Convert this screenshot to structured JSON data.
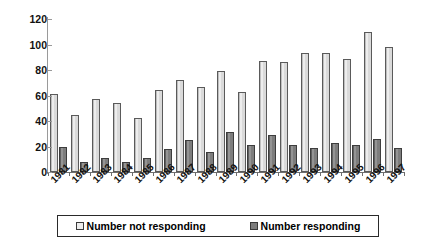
{
  "chart_data": {
    "type": "bar",
    "title": "",
    "xlabel": "",
    "ylabel": "",
    "ylim": [
      0,
      120
    ],
    "yticks": [
      0,
      20,
      40,
      60,
      80,
      100,
      120
    ],
    "grid": false,
    "legend_position": "bottom",
    "categories": [
      "1981",
      "1982",
      "1983",
      "1984",
      "1985",
      "1986",
      "1987",
      "1988",
      "1989",
      "1990",
      "1991",
      "1992",
      "1993",
      "1994",
      "1995",
      "1996",
      "1997"
    ],
    "series": [
      {
        "name": "Number not responding",
        "color": "#dcdcdc",
        "values": [
          61,
          45,
          57,
          54,
          42,
          64,
          72,
          67,
          79,
          63,
          87,
          86,
          93,
          93,
          89,
          110,
          98
        ]
      },
      {
        "name": "Number responding",
        "color": "#808080",
        "values": [
          20,
          8,
          11,
          8,
          11,
          18,
          25,
          16,
          31,
          21,
          29,
          21,
          19,
          23,
          21,
          26,
          19
        ]
      }
    ]
  },
  "legend": {
    "items": [
      {
        "label": "Number not responding",
        "swatch": "light"
      },
      {
        "label": "Number responding",
        "swatch": "dark"
      }
    ]
  }
}
